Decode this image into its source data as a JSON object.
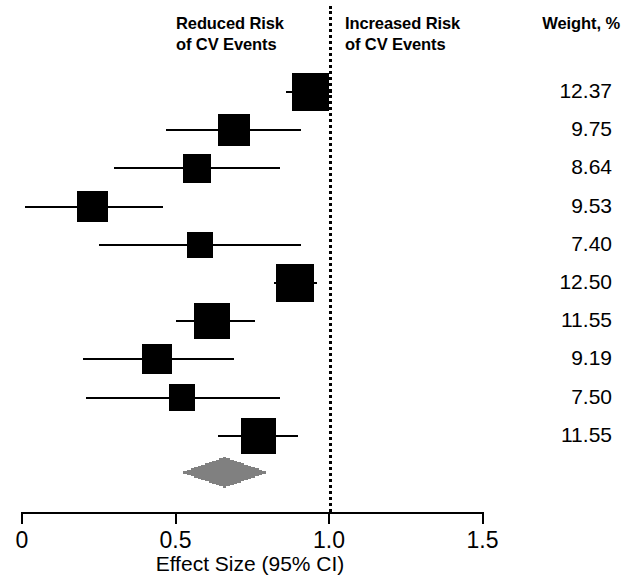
{
  "figure": {
    "type": "forest-plot",
    "headers": {
      "left_label": "Reduced Risk\nof CV Events",
      "right_label": "Increased Risk\nof CV Events",
      "weight_label": "Weight, %"
    },
    "axis": {
      "title": "Effect Size (95% CI)",
      "ticks": [
        "0",
        "0.5",
        "1.0",
        "1.5"
      ],
      "tick_values": [
        0,
        0.5,
        1.0,
        1.5
      ],
      "range": [
        0,
        1.5
      ],
      "null_value": 1.0
    },
    "colors": {
      "marker": "#000000",
      "line": "#000000",
      "diamond": "#808080",
      "background": "#ffffff"
    }
  },
  "chart_data": {
    "type": "forest",
    "title": "",
    "xlabel": "Effect Size (95% CI)",
    "ylabel": "",
    "xlim": [
      0,
      1.5
    ],
    "xticks": [
      0,
      0.5,
      1.0,
      1.5
    ],
    "xticklabels": [
      "0",
      "0.5",
      "1.0",
      "1.5"
    ],
    "grid": false,
    "null_line": 1.0,
    "legend": null,
    "annotations": [
      "Reduced Risk of CV Events",
      "Increased Risk of CV Events",
      "Weight, %"
    ],
    "columns": [
      "effect",
      "ci_low",
      "ci_high",
      "weight"
    ],
    "rows": [
      {
        "effect": 0.94,
        "ci_low": 0.86,
        "ci_high": 1.01,
        "weight": "12.37"
      },
      {
        "effect": 0.69,
        "ci_low": 0.47,
        "ci_high": 0.91,
        "weight": "9.75"
      },
      {
        "effect": 0.57,
        "ci_low": 0.3,
        "ci_high": 0.84,
        "weight": "8.64"
      },
      {
        "effect": 0.23,
        "ci_low": 0.01,
        "ci_high": 0.46,
        "weight": "9.53"
      },
      {
        "effect": 0.58,
        "ci_low": 0.25,
        "ci_high": 0.91,
        "weight": "7.40"
      },
      {
        "effect": 0.89,
        "ci_low": 0.82,
        "ci_high": 0.96,
        "weight": "12.50"
      },
      {
        "effect": 0.62,
        "ci_low": 0.5,
        "ci_high": 0.76,
        "weight": "11.55"
      },
      {
        "effect": 0.44,
        "ci_low": 0.2,
        "ci_high": 0.69,
        "weight": "9.19"
      },
      {
        "effect": 0.52,
        "ci_low": 0.21,
        "ci_high": 0.84,
        "weight": "7.50"
      },
      {
        "effect": 0.77,
        "ci_low": 0.64,
        "ci_high": 0.9,
        "weight": "11.55"
      }
    ],
    "summary": {
      "effect": 0.66,
      "ci_low": 0.52,
      "ci_high": 0.8,
      "weight": ""
    }
  }
}
